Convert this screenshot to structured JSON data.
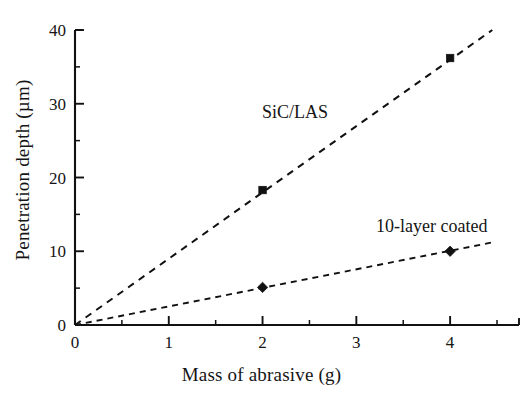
{
  "chart_data": {
    "type": "line",
    "title": "",
    "subtitle": "",
    "xlabel": "Mass of abrasive (g)",
    "ylabel": "Penetration depth (µm)",
    "xlim": [
      0,
      4.5
    ],
    "ylim": [
      0,
      40
    ],
    "grid": false,
    "legend_position": "inline-annotations",
    "x_ticks_major": [
      0,
      1,
      2,
      3,
      4
    ],
    "x_tick_labels": [
      "0",
      "1",
      "2",
      "3",
      "4"
    ],
    "x_ticks_minor": [
      0.5,
      1.5,
      2.5,
      3.5,
      4.5
    ],
    "y_ticks_major": [
      0,
      10,
      20,
      30,
      40
    ],
    "y_tick_labels": [
      "0",
      "10",
      "20",
      "30",
      "40"
    ],
    "y_ticks_minor": [
      5,
      15,
      25,
      35
    ],
    "series": [
      {
        "name": "SiC/LAS",
        "marker": "square",
        "linestyle": "dashed",
        "color": "#111111",
        "points": [
          {
            "x": 2,
            "y": 18.3
          },
          {
            "x": 4,
            "y": 36.2
          }
        ],
        "fit_line": [
          {
            "x": 0,
            "y": 0
          },
          {
            "x": 4.45,
            "y": 40.0
          }
        ],
        "annotation": "SiC/LAS"
      },
      {
        "name": "10-layer coated",
        "marker": "diamond",
        "linestyle": "dashed",
        "color": "#111111",
        "points": [
          {
            "x": 2,
            "y": 5.1
          },
          {
            "x": 4,
            "y": 10.0
          }
        ],
        "fit_line": [
          {
            "x": 0,
            "y": 0
          },
          {
            "x": 4.45,
            "y": 11.2
          }
        ],
        "annotation": "10-layer coated"
      }
    ]
  },
  "annotations": {
    "sic_las": "SiC/LAS",
    "coated": "10-layer coated"
  },
  "axes": {
    "x_title": "Mass of abrasive (g)",
    "y_title": "Penetration depth (µm)"
  }
}
